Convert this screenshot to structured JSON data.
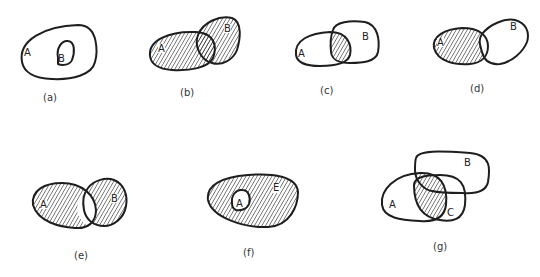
{
  "diagrams": [
    {
      "id": "a",
      "caption": "(a)",
      "labels": [
        "A",
        "B"
      ],
      "description": "B is a subset of A; no shading"
    },
    {
      "id": "b",
      "caption": "(b)",
      "labels": [
        "A",
        "B"
      ],
      "description": "A union B shaded"
    },
    {
      "id": "c",
      "caption": "(c)",
      "labels": [
        "A",
        "B"
      ],
      "description": "A intersect B shaded"
    },
    {
      "id": "d",
      "caption": "(d)",
      "labels": [
        "A",
        "B"
      ],
      "description": "A minus B shaded"
    },
    {
      "id": "e",
      "caption": "(e)",
      "labels": [
        "A",
        "B"
      ],
      "description": "Symmetric difference of A and B shaded"
    },
    {
      "id": "f",
      "caption": "(f)",
      "labels": [
        "A",
        "E"
      ],
      "description": "Complement of A within universe E shaded"
    },
    {
      "id": "g",
      "caption": "(g)",
      "labels": [
        "A",
        "B",
        "C"
      ],
      "description": "A intersect (B union C) shaded"
    }
  ],
  "colors": {
    "stroke": "#1e1e1e",
    "hatch": "#2a2a2a",
    "background": "#ffffff"
  }
}
